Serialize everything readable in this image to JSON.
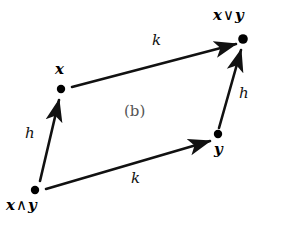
{
  "figure": {
    "caption": "(b)",
    "caption_x": 124,
    "caption_y": 104,
    "width": 283,
    "height": 225,
    "background": "#ffffff",
    "stroke_color": "#111111",
    "node_color": "#000000",
    "caption_color": "#555555"
  },
  "nodes": [
    {
      "id": "meet",
      "label_parts": {
        "left": "x",
        "op": "∧",
        "right": "y"
      },
      "label_text": "x ∧ y",
      "dot_x": 35,
      "dot_y": 190,
      "dot_r": 4.2,
      "label_x": 6,
      "label_y": 198
    },
    {
      "id": "x",
      "label_parts": {
        "left": "x",
        "op": "",
        "right": ""
      },
      "label_text": "x",
      "dot_x": 61,
      "dot_y": 89,
      "dot_r": 4.2,
      "label_x": 55,
      "label_y": 62
    },
    {
      "id": "y",
      "label_parts": {
        "left": "y",
        "op": "",
        "right": ""
      },
      "label_text": "y",
      "dot_x": 218,
      "dot_y": 134,
      "dot_r": 4.2,
      "label_x": 214,
      "label_y": 142
    },
    {
      "id": "join",
      "label_parts": {
        "left": "x",
        "op": "∨",
        "right": "y"
      },
      "label_text": "x ∨ y",
      "dot_x": 243,
      "dot_y": 39,
      "dot_r": 4.8,
      "label_x": 213,
      "label_y": 8
    }
  ],
  "edges": [
    {
      "id": "edge-k-top",
      "label": "k",
      "from": "x",
      "to": "join",
      "x1": 72,
      "y1": 87,
      "x2": 236,
      "y2": 44,
      "label_x": 152,
      "label_y": 33
    },
    {
      "id": "edge-k-bottom",
      "label": "k",
      "from": "meet",
      "to": "y",
      "x1": 46,
      "y1": 189,
      "x2": 210,
      "y2": 141,
      "label_x": 131,
      "label_y": 171
    },
    {
      "id": "edge-h-left",
      "label": "h",
      "from": "meet",
      "to": "x",
      "x1": 40,
      "y1": 181,
      "x2": 59,
      "y2": 100,
      "label_x": 25,
      "label_y": 126
    },
    {
      "id": "edge-h-right",
      "label": "h",
      "from": "y",
      "to": "join",
      "x1": 219,
      "y1": 128,
      "x2": 241,
      "y2": 50,
      "label_x": 239,
      "label_y": 86
    }
  ]
}
